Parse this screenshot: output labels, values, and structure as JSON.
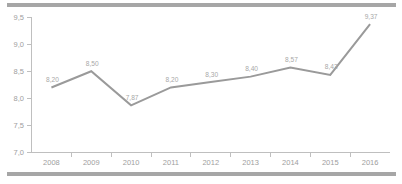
{
  "decorations": {
    "top_rule_color": "#a6a6a6",
    "bottom_rule_color": "#a6a6a6"
  },
  "chart_data": {
    "type": "line",
    "title": "",
    "subtitle": "",
    "xlabel": "",
    "ylabel": "",
    "categories": [
      "2008",
      "2009",
      "2010",
      "2011",
      "2012",
      "2013",
      "2014",
      "2015",
      "2016"
    ],
    "values": [
      8.2,
      8.5,
      7.87,
      8.2,
      8.3,
      8.4,
      8.57,
      8.43,
      9.37
    ],
    "point_labels": [
      "8,20",
      "8,50",
      "7,87",
      "8,20",
      "8,30",
      "8,40",
      "8,57",
      "8,43",
      "9,37"
    ],
    "ylim": [
      7.0,
      9.5
    ],
    "ytick_values": [
      9.5,
      9.0,
      8.5,
      8.0,
      7.5,
      7.0
    ],
    "ytick_labels": [
      "9,5",
      "9,0",
      "8,5",
      "8,0",
      "7,5",
      "7,0"
    ],
    "grid": false,
    "legend": false,
    "series": [
      {
        "name": "",
        "color": "#9a9a9a",
        "values": [
          8.2,
          8.5,
          7.87,
          8.2,
          8.3,
          8.4,
          8.57,
          8.43,
          9.37
        ]
      }
    ],
    "axis_color": "#bfbfbf",
    "label_color": "#9e9e9e",
    "data_label_color": "#a8a8a8"
  }
}
